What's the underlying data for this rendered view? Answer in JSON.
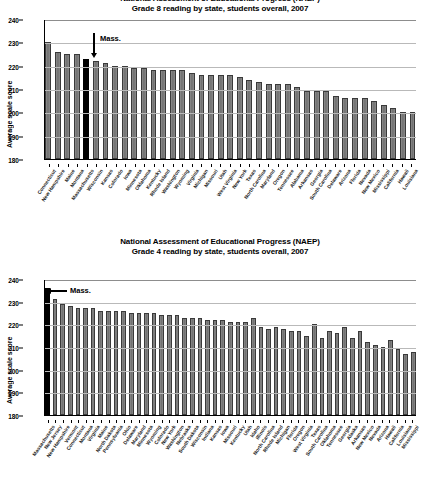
{
  "charts": [
    {
      "id": "grade8",
      "title_line1": "National Assessment of Educational Progress (NAEP)",
      "title_line2": "Grade 8 reading by state, students overall, 2007",
      "annotation": "Mass.",
      "chart_data": {
        "type": "bar",
        "title": "Grade 8 reading by state, students overall, 2007",
        "xlabel": "",
        "ylabel": "Average scale score",
        "ylim": [
          180,
          240
        ],
        "yticks": [
          180,
          190,
          200,
          210,
          220,
          230,
          240
        ],
        "grid": true,
        "legend": "none",
        "highlight": "Massachusetts",
        "highlight_color": "#000000",
        "bar_color": "#777777",
        "categories": [
          "Connecticut",
          "New Hampshire",
          "Maine",
          "Montana",
          "Massachusetts",
          "Wisconsin",
          "Kansas",
          "Colorado",
          "Iowa",
          "Minnesota",
          "Oklahoma",
          "Kentucky",
          "Rhode Island",
          "Washington",
          "Wyoming",
          "Virginia",
          "Michigan",
          "Missouri",
          "Utah",
          "West Virginia",
          "New York",
          "Texas",
          "North Carolina",
          "Maryland",
          "Oregon",
          "Tennessee",
          "Alabama",
          "Arkansas",
          "Georgia",
          "South Carolina",
          "Delaware",
          "Arizona",
          "Florida",
          "Nevada",
          "New Mexico",
          "Mississippi",
          "California",
          "Hawaii",
          "Louisiana"
        ],
        "values": [
          230,
          226,
          225,
          225,
          223,
          222,
          221,
          220,
          220,
          219,
          219,
          218,
          218,
          218,
          218,
          217,
          216,
          216,
          216,
          216,
          215,
          214,
          213,
          212,
          212,
          212,
          211,
          209,
          209,
          209,
          207,
          206,
          206,
          206,
          205,
          203,
          202,
          200,
          200
        ]
      }
    },
    {
      "id": "grade4",
      "title_line1": "National Assessment of Educational Progress (NAEP)",
      "title_line2": "Grade 4 reading by state, students overall, 2007",
      "annotation": "Mass.",
      "chart_data": {
        "type": "bar",
        "title": "Grade 4 reading by state, students overall, 2007",
        "xlabel": "",
        "ylabel": "Average scale score",
        "ylim": [
          180,
          240
        ],
        "yticks": [
          180,
          190,
          200,
          210,
          220,
          230,
          240
        ],
        "grid": true,
        "legend": "none",
        "highlight": "Massachusetts",
        "highlight_color": "#000000",
        "bar_color": "#777777",
        "categories": [
          "Massachusetts",
          "New Jersey",
          "New Hampshire",
          "Vermont",
          "Connecticut",
          "Montana",
          "Virginia",
          "Maine",
          "North Dakota",
          "Pennsylvania",
          "Ohio",
          "Delaware",
          "Maryland",
          "Minnesota",
          "Wyoming",
          "Colorado",
          "New York",
          "Washington",
          "Nebraska",
          "South Dakota",
          "Wisconsin",
          "Indiana",
          "Kansas",
          "Iowa",
          "Missouri",
          "Kentucky",
          "Utah",
          "Idaho",
          "Illinois",
          "North Carolina",
          "Rhode Island",
          "Michigan",
          "Florida",
          "Oregon",
          "West Virginia",
          "Texas",
          "South Carolina",
          "Oklahoma",
          "Tennessee",
          "Georgia",
          "Alaska",
          "Arkansas",
          "New Mexico",
          "Nevada",
          "Arizona",
          "Hawaii",
          "California",
          "Louisiana",
          "Mississippi"
        ],
        "values": [
          236,
          231,
          229,
          228,
          227,
          227,
          227,
          226,
          226,
          226,
          226,
          225,
          225,
          225,
          225,
          224,
          224,
          224,
          223,
          223,
          223,
          222,
          222,
          222,
          221,
          221,
          221,
          223,
          219,
          218,
          219,
          218,
          217,
          217,
          215,
          220,
          214,
          217,
          216,
          219,
          214,
          217,
          212,
          211,
          210,
          213,
          209,
          207,
          208
        ]
      }
    }
  ]
}
